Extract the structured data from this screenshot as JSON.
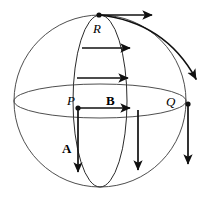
{
  "figure": {
    "canvas": {
      "width": 204,
      "height": 198,
      "background": "#ffffff"
    },
    "colors": {
      "outline": "#3a3a3a",
      "meridian": "#2a2a2a",
      "vector": "#101010",
      "label": "#000000"
    },
    "sphere": {
      "cx": 100,
      "cy": 101,
      "r": 86
    },
    "equator": {
      "cx": 100,
      "cy": 101,
      "rx": 86,
      "ry": 17
    },
    "meridian": {
      "cx": 100,
      "cy": 101,
      "rx": 27,
      "ry": 86
    },
    "points": [
      {
        "name": "R",
        "label": "R",
        "style": "italic",
        "x": 99,
        "y": 15,
        "label_x": 93,
        "label_y": 22
      },
      {
        "name": "P",
        "label": "P",
        "style": "italic",
        "x": 78,
        "y": 108,
        "label_x": 67,
        "label_y": 94
      },
      {
        "name": "Q",
        "label": "Q",
        "style": "italic",
        "x": 188,
        "y": 104,
        "label_x": 166,
        "label_y": 95
      }
    ],
    "vector_labels": [
      {
        "name": "A",
        "label": "A",
        "style": "bold",
        "x": 62,
        "y": 142
      },
      {
        "name": "B",
        "label": "B",
        "style": "bold",
        "x": 106,
        "y": 94
      }
    ],
    "horizontal_vectors": [
      {
        "name": "vector-at-R",
        "x1": 99,
        "y1": 15,
        "x2": 152,
        "y2": 15
      },
      {
        "name": "vector-upper",
        "x1": 82,
        "y1": 48,
        "x2": 130,
        "y2": 48
      },
      {
        "name": "vector-mid",
        "x1": 77,
        "y1": 78,
        "x2": 128,
        "y2": 78
      },
      {
        "name": "vector-B",
        "x1": 78,
        "y1": 108,
        "x2": 130,
        "y2": 108
      }
    ],
    "vertical_vectors": [
      {
        "name": "vector-A",
        "x1": 78,
        "y1": 108,
        "x2": 78,
        "y2": 172
      },
      {
        "name": "vector-interior",
        "x1": 138,
        "y1": 110,
        "x2": 138,
        "y2": 170
      },
      {
        "name": "vector-at-Q",
        "x1": 188,
        "y1": 104,
        "x2": 188,
        "y2": 164
      }
    ],
    "curved_vector": {
      "name": "tangent-curve-from-R",
      "start_x": 99,
      "start_y": 15,
      "ctrl_x": 165,
      "ctrl_y": 22,
      "end_x": 196,
      "end_y": 79
    }
  }
}
